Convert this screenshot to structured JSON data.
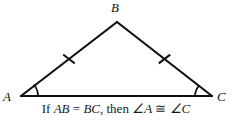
{
  "figure": {
    "stroke_color": "#111111",
    "background_color": "#ffffff",
    "stroke_width": 2,
    "vertices": [
      {
        "name": "A",
        "label": "A",
        "x": 21,
        "y": 96
      },
      {
        "name": "B",
        "label": "B",
        "x": 117,
        "y": 22
      },
      {
        "name": "C",
        "label": "C",
        "x": 212,
        "y": 96
      }
    ],
    "sides": [
      {
        "name": "AB",
        "from": "A",
        "to": "B",
        "tick_marks": 1
      },
      {
        "name": "BC",
        "from": "B",
        "to": "C",
        "tick_marks": 1
      },
      {
        "name": "AC",
        "from": "A",
        "to": "C",
        "tick_marks": 0
      }
    ],
    "angle_marks": [
      {
        "at": "A",
        "arcs": 1
      },
      {
        "at": "C",
        "arcs": 1
      }
    ]
  },
  "caption": {
    "full_text": "If AB = BC, then ∠A ≅ ∠C",
    "if_word": "If",
    "segment_1": "AB",
    "equals_sign": "=",
    "segment_2": "BC",
    "comma": ",",
    "then_word": "then",
    "angle_1": "∠A",
    "congruent_sign": "≅",
    "angle_2": "∠C"
  }
}
